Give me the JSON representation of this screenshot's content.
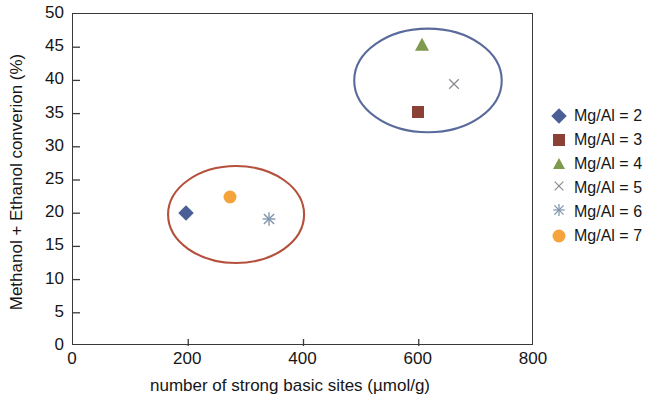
{
  "chart_data": {
    "type": "scatter",
    "title": "",
    "xlabel": "number of strong basic sites (µmol/g)",
    "ylabel": "Methanol + Ethanol converion (%)",
    "xlim": [
      0,
      800
    ],
    "ylim": [
      0,
      50
    ],
    "xticks": [
      "0",
      "200",
      "400",
      "600",
      "800"
    ],
    "xtick_values": [
      0,
      200,
      400,
      600,
      800
    ],
    "yticks": [
      "0",
      "5",
      "10",
      "15",
      "20",
      "25",
      "30",
      "35",
      "40",
      "45",
      "50"
    ],
    "ytick_values": [
      0,
      5,
      10,
      15,
      20,
      25,
      30,
      35,
      40,
      45,
      50
    ],
    "grid": false,
    "legend_position": "right",
    "series": [
      {
        "name": "Mg/Al = 2",
        "marker": "diamond",
        "color": "#4a5f96",
        "x": [
          196
        ],
        "y": [
          20.0
        ]
      },
      {
        "name": "Mg/Al = 3",
        "marker": "square",
        "color": "#8c4136",
        "x": [
          598
        ],
        "y": [
          35.2
        ]
      },
      {
        "name": "Mg/Al = 4",
        "marker": "triangle",
        "color": "#7d9a4e",
        "x": [
          605
        ],
        "y": [
          45.3
        ]
      },
      {
        "name": "Mg/Al = 5",
        "marker": "cross",
        "color": "#8b8b93",
        "x": [
          661
        ],
        "y": [
          39.2
        ]
      },
      {
        "name": "Mg/Al = 6",
        "marker": "star",
        "color": "#7e93ab",
        "x": [
          340
        ],
        "y": [
          18.8
        ]
      },
      {
        "name": "Mg/Al = 7",
        "marker": "circle",
        "color": "#f5a33c",
        "x": [
          272
        ],
        "y": [
          22.5
        ]
      }
    ],
    "annotations": [
      {
        "type": "ellipse",
        "name": "low-conversion-cluster-ellipse",
        "color": "#b4503c",
        "cx": 283,
        "cy": 19.8,
        "rx": 118,
        "ry": 7.3
      },
      {
        "type": "ellipse",
        "name": "high-conversion-cluster-ellipse",
        "color": "#5a6a9c",
        "cx": 616,
        "cy": 40.0,
        "rx": 128,
        "ry": 7.8
      }
    ]
  },
  "axes": {
    "ylabel": "Methanol + Ethanol converion (%)",
    "xlabel": "number of strong basic sites (µmol/g)"
  },
  "legend": {
    "items": [
      {
        "label": "Mg/Al = 2",
        "marker": "diamond",
        "color": "#4a5f96"
      },
      {
        "label": "Mg/Al = 3",
        "marker": "square",
        "color": "#8c4136"
      },
      {
        "label": "Mg/Al = 4",
        "marker": "triangle",
        "color": "#7d9a4e"
      },
      {
        "label": "Mg/Al = 5",
        "marker": "cross",
        "color": "#8b8b93"
      },
      {
        "label": "Mg/Al = 6",
        "marker": "star",
        "color": "#7e93ab"
      },
      {
        "label": "Mg/Al = 7",
        "marker": "circle",
        "color": "#f5a33c"
      }
    ]
  }
}
